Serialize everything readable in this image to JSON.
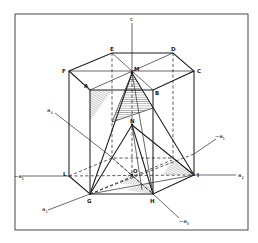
{
  "figure": {
    "frame_color": "#333333",
    "line_color": "#1e1e1e",
    "vertices": {
      "A": {
        "label": "A",
        "x": 90,
        "y": 90
      },
      "B": {
        "label": "B",
        "x": 153,
        "y": 90
      },
      "C": {
        "label": "C",
        "x": 194,
        "y": 71
      },
      "D": {
        "label": "D",
        "x": 173,
        "y": 53
      },
      "E": {
        "label": "E",
        "x": 112,
        "y": 53
      },
      "F": {
        "label": "F",
        "x": 69,
        "y": 71
      },
      "G": {
        "label": "G",
        "x": 90,
        "y": 194
      },
      "H": {
        "label": "H",
        "x": 153,
        "y": 194
      },
      "I": {
        "label": "I",
        "x": 194,
        "y": 175
      },
      "L": {
        "label": "L",
        "x": 69,
        "y": 176
      },
      "M": {
        "label": "M",
        "x": 132,
        "y": 73
      },
      "N": {
        "label": "N",
        "x": 132,
        "y": 125
      },
      "O": {
        "label": "O",
        "x": 132,
        "y": 175
      }
    },
    "axes": {
      "c": {
        "label": "c"
      },
      "a1": {
        "label": "a",
        "sub": "1"
      },
      "neg_a1": {
        "label": "−a",
        "sub": "1"
      },
      "a2": {
        "label": "a",
        "sub": "2"
      },
      "neg_a2": {
        "label": "−a",
        "sub": "2"
      },
      "a3": {
        "label": "a",
        "sub": "3"
      },
      "neg_a3": {
        "label": "−a",
        "sub": "3"
      }
    }
  }
}
